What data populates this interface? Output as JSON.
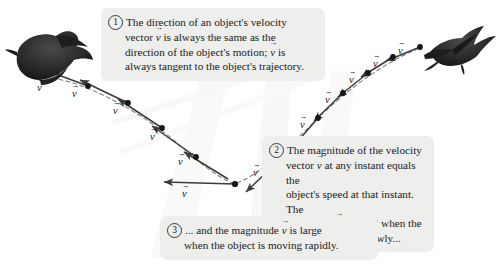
{
  "figure": {
    "background": "#ffffff",
    "ink_color": "#3b3b3d",
    "dot_color": "#17171a",
    "callout_bg": "#eeeeec"
  },
  "callouts": [
    {
      "number": "1",
      "line1": "The direction of an object's velocity",
      "line2_a": "vector ",
      "line2_v": "v",
      "line2_b": " is always the same as the",
      "line3_a": "direction of the object's motion; ",
      "line3_v": "v",
      "line3_b": " is",
      "line4": "always tangent to the object's trajectory."
    },
    {
      "number": "2",
      "line1": "The magnitude of the velocity",
      "line2_a": "vector ",
      "line2_v": "v",
      "line2_b": " at any instant equals the",
      "line3": "object's speed at that instant. The",
      "line4_a": "magnitude ",
      "line4_v": "v",
      "line4_b": " is small when the",
      "line5": "object is moving slowly..."
    },
    {
      "number": "3",
      "line1_a": "... and the magnitude ",
      "line1_v": "v",
      "line1_b": " is large",
      "line2": "when the object is moving rapidly."
    }
  ],
  "vector_labels": [
    {
      "id": "v-left-1",
      "text": "v",
      "x": 37,
      "y": 88
    },
    {
      "id": "v-left-2",
      "text": "v",
      "x": 70,
      "y": 93
    },
    {
      "id": "v-left-3",
      "text": "v",
      "x": 114,
      "y": 107
    },
    {
      "id": "v-left-4",
      "text": "v",
      "x": 150,
      "y": 132
    },
    {
      "id": "v-left-5",
      "text": "v",
      "x": 178,
      "y": 155
    },
    {
      "id": "v-bottom",
      "text": "v",
      "x": 180,
      "y": 192
    },
    {
      "id": "v-right-1",
      "text": "v",
      "x": 258,
      "y": 170
    },
    {
      "id": "v-right-2",
      "text": "v",
      "x": 283,
      "y": 148
    },
    {
      "id": "v-right-3",
      "text": "v",
      "x": 305,
      "y": 121
    },
    {
      "id": "v-right-4",
      "text": "v",
      "x": 330,
      "y": 96
    },
    {
      "id": "v-right-5",
      "text": "v",
      "x": 352,
      "y": 76
    },
    {
      "id": "v-right-6",
      "text": "v",
      "x": 375,
      "y": 60
    },
    {
      "id": "v-right-7",
      "text": "v",
      "x": 400,
      "y": 47
    }
  ],
  "trajectory": {
    "description": "parabolic arc from upper-right (hawk) down to a minimum near x=235 then up to the left (crow)",
    "points": [
      {
        "x": 52,
        "y": 78
      },
      {
        "x": 88,
        "y": 86
      },
      {
        "x": 128,
        "y": 103
      },
      {
        "x": 162,
        "y": 128
      },
      {
        "x": 196,
        "y": 157
      },
      {
        "x": 235,
        "y": 184
      },
      {
        "x": 272,
        "y": 167
      },
      {
        "x": 296,
        "y": 143
      },
      {
        "x": 318,
        "y": 118
      },
      {
        "x": 343,
        "y": 93
      },
      {
        "x": 368,
        "y": 73
      },
      {
        "x": 393,
        "y": 57
      },
      {
        "x": 418,
        "y": 48
      }
    ]
  },
  "birds": [
    {
      "id": "crow",
      "position": "upper-left",
      "x": 8,
      "y": 30
    },
    {
      "id": "hawk",
      "position": "upper-right",
      "x": 400,
      "y": 8
    }
  ]
}
